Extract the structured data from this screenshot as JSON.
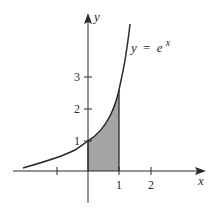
{
  "diagram": {
    "curve_label": {
      "lhs": "y",
      "eq": "=",
      "base": "e",
      "exponent": "x"
    },
    "axes": {
      "x_label": "x",
      "y_label": "y",
      "x_ticks": [
        {
          "value": -1,
          "label": ""
        },
        {
          "value": 1,
          "label": "1"
        },
        {
          "value": 2,
          "label": "2"
        }
      ],
      "y_ticks": [
        {
          "value": 1,
          "label": "1"
        },
        {
          "value": 2,
          "label": "2"
        },
        {
          "value": 3,
          "label": "3"
        }
      ]
    },
    "shaded_region": {
      "from_x": 0,
      "to_x": 1,
      "under": "y = e^x"
    },
    "colors": {
      "line": "#2a2a2a",
      "fill": "#a4a4a4",
      "background": "#ffffff"
    }
  }
}
